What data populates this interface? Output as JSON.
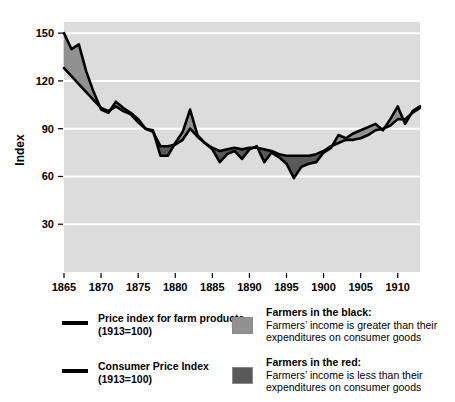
{
  "chart_data": {
    "type": "area",
    "title": "",
    "xlabel": "",
    "ylabel": "Index",
    "xlim": [
      1865,
      1913
    ],
    "ylim": [
      0,
      157
    ],
    "grid": true,
    "grid_axis": "y",
    "legend_position": "below",
    "x_ticks": [
      "1865",
      "1870",
      "1875",
      "1880",
      "1885",
      "1890",
      "1895",
      "1900",
      "1905",
      "1910"
    ],
    "x_tick_values": [
      1865,
      1870,
      1875,
      1880,
      1885,
      1890,
      1895,
      1900,
      1905,
      1910
    ],
    "y_ticks": [
      "30",
      "60",
      "90",
      "120",
      "150"
    ],
    "y_tick_values": [
      30,
      60,
      90,
      120,
      150
    ],
    "x": [
      1865,
      1866,
      1867,
      1868,
      1869,
      1870,
      1871,
      1872,
      1873,
      1874,
      1875,
      1876,
      1877,
      1878,
      1879,
      1880,
      1881,
      1882,
      1883,
      1884,
      1885,
      1886,
      1887,
      1888,
      1889,
      1890,
      1891,
      1892,
      1893,
      1894,
      1895,
      1896,
      1897,
      1898,
      1899,
      1900,
      1901,
      1902,
      1903,
      1904,
      1905,
      1906,
      1907,
      1908,
      1909,
      1910,
      1911,
      1912,
      1913
    ],
    "series": [
      {
        "name": "Price index for farm products (1913=100)",
        "color": "#000000",
        "values": [
          150,
          140,
          143,
          126,
          113,
          102,
          100,
          107,
          103,
          100,
          96,
          90,
          89,
          73,
          73,
          81,
          88,
          102,
          86,
          81,
          77,
          69,
          74,
          76,
          71,
          77,
          79,
          69,
          75,
          72,
          68,
          59,
          66,
          68,
          69,
          75,
          78,
          86,
          84,
          87,
          89,
          91,
          93,
          89,
          96,
          104,
          93,
          101,
          104
        ]
      },
      {
        "name": "Consumer Price Index (1913=100)",
        "color": "#000000",
        "values": [
          128,
          123,
          118,
          113,
          108,
          103,
          101,
          104,
          101,
          99,
          94,
          90,
          88,
          79,
          79,
          80,
          83,
          90,
          85,
          81,
          78,
          76,
          77,
          78,
          77,
          78,
          78,
          77,
          76,
          74,
          73,
          73,
          73,
          73,
          74,
          76,
          79,
          81,
          83,
          83,
          84,
          86,
          89,
          90,
          92,
          96,
          96,
          100,
          103
        ]
      }
    ],
    "fills": [
      {
        "name": "Farmers in the black",
        "color": "#919191",
        "meaning": "farm price index above consumer price index"
      },
      {
        "name": "Farmers in the red",
        "color": "#595959",
        "meaning": "farm price index below consumer price index"
      }
    ],
    "plot_background": "#dcdcdc",
    "gridline_color": "#ffffff"
  },
  "axis": {
    "y_title": "Index"
  },
  "legend": {
    "lines": [
      {
        "swatch": "black-line-swatch",
        "line1": "Price index for farm products",
        "line2": "(1913=100)"
      },
      {
        "swatch": "black-line-swatch",
        "line1": "Consumer Price Index",
        "line2": "(1913=100)"
      }
    ],
    "fills": [
      {
        "swatch": "light-gray-swatch",
        "title": "Farmers in the black:",
        "desc1": "Farmers’ income is greater than their",
        "desc2": "expenditures on consumer goods"
      },
      {
        "swatch": "dark-gray-swatch",
        "title": "Farmers in the red:",
        "desc1": "Farmers’ income is less than their",
        "desc2": "expenditures on consumer goods"
      }
    ]
  }
}
